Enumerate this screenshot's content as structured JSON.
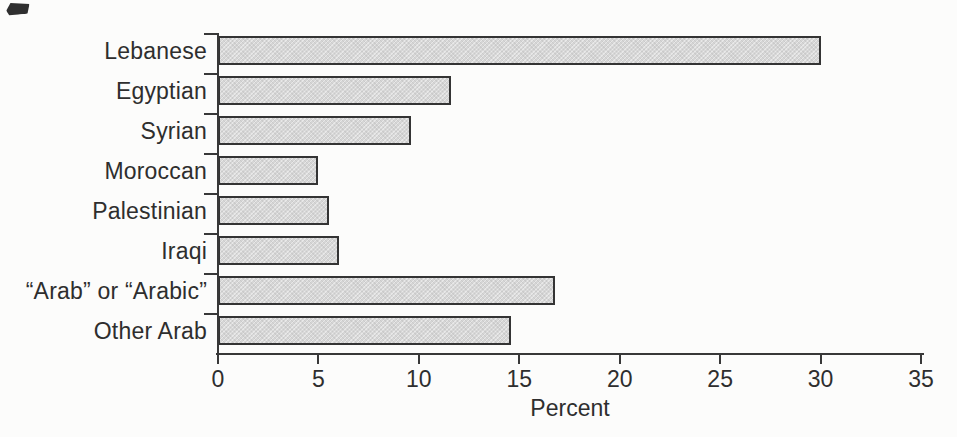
{
  "page": {
    "background": "#fcfcfb",
    "kind": "scanned statistical figure"
  },
  "chart_data": {
    "type": "bar",
    "orientation": "horizontal",
    "categories": [
      "Lebanese",
      "Egyptian",
      "Syrian",
      "Moroccan",
      "Palestinian",
      "Iraqi",
      "“Arab” or “Arabic”",
      "Other Arab"
    ],
    "values": [
      30,
      11.6,
      9.6,
      5,
      5.5,
      6,
      16.8,
      14.6
    ],
    "title": "",
    "xlabel": "Percent",
    "ylabel": "",
    "xlim": [
      0,
      35
    ],
    "xticks": [
      0,
      5,
      10,
      15,
      20,
      25,
      30,
      35
    ],
    "grid": false,
    "legend": false,
    "bar_fill": "#d6d6d6",
    "bar_border": "#343434",
    "axis_color": "#383838",
    "text_color": "#2e2e2e"
  }
}
